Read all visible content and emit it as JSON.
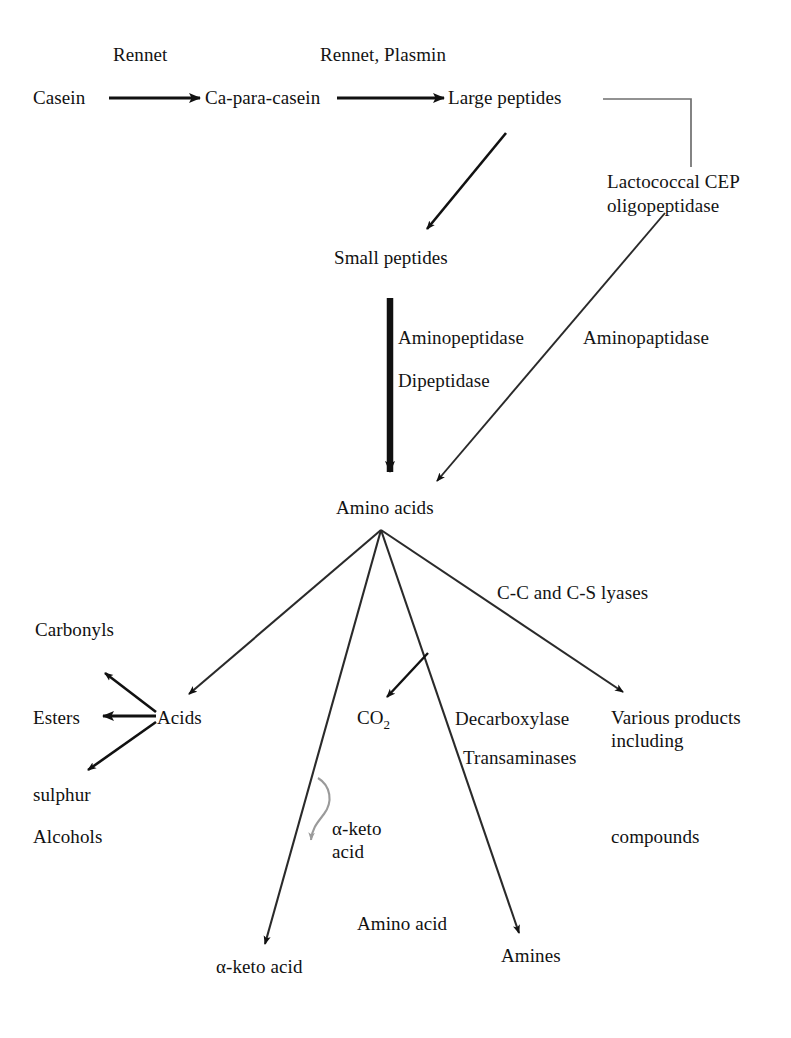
{
  "diagram": {
    "ink_color": "#111111",
    "faint_ink_color": "#9a9a9a",
    "background": "#ffffff",
    "nodes": {
      "casein": "Casein",
      "ca_para_casein": "Ca-para-casein",
      "large_peptides": "Large peptides",
      "small_peptides": "Small peptides",
      "amino_acids": "Amino acids",
      "acids": "Acids",
      "carbonyls": "Carbonyls",
      "esters": "Esters",
      "sulphur": "sulphur",
      "alcohols": "Alcohols",
      "co2": "CO",
      "co2_subscript": "2",
      "alpha_keto_acid_mid_line1": "α-keto",
      "alpha_keto_acid_mid_line2": "acid",
      "alpha_keto_acid_bottom": "α-keto acid",
      "amino_acid_bottom": "Amino acid",
      "amines": "Amines",
      "various_products_line1": "Various products",
      "various_products_line2": "including",
      "compounds": "compounds"
    },
    "enzymes": {
      "rennet": "Rennet",
      "rennet_plasmin": "Rennet, Plasmin",
      "lactococcal_cep_line1": "Lactococcal CEP",
      "lactococcal_cep_line2": "oligopeptidase",
      "aminopeptidase": "Aminopeptidase",
      "dipeptidase": "Dipeptidase",
      "aminopaptidase": "Aminopaptidase",
      "cc_cs_lyases": "C-C and C-S lyases",
      "decarboxylase": "Decarboxylase",
      "transaminases": "Transaminases"
    }
  }
}
